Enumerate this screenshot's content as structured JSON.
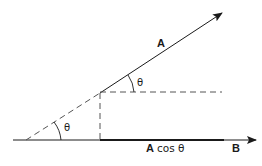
{
  "diagram": {
    "labels": {
      "vector_a": "A",
      "vector_b": "B",
      "projection_a": "A",
      "projection_cos": "cos θ",
      "angle_upper": "θ",
      "angle_lower": "θ"
    },
    "colors": {
      "line": "#1a1a1a",
      "dashed": "#555555",
      "background": "#ffffff"
    }
  }
}
